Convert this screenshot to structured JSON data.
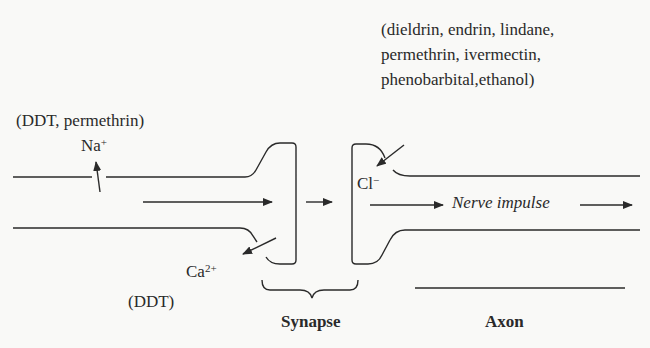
{
  "diagram": {
    "type": "nerve-synapse-schematic",
    "labels": {
      "toxins_chloride_line1": "(dieldrin, endrin, lindane,",
      "toxins_chloride_line2": "permethrin, ivermectin,",
      "toxins_chloride_line3": "phenobarbital,ethanol)",
      "toxins_sodium": "(DDT, permethrin)",
      "sodium_ion": "Na",
      "sodium_charge": "+",
      "chloride_ion": "Cl",
      "chloride_charge": "−",
      "calcium_ion": "Ca",
      "calcium_charge": "2+",
      "toxins_calcium": "(DDT)",
      "nerve_impulse": "Nerve impulse",
      "synapse": "Synapse",
      "axon": "Axon"
    },
    "colors": {
      "ink": "#2a2a2a",
      "background": "#f9f9f7"
    }
  }
}
